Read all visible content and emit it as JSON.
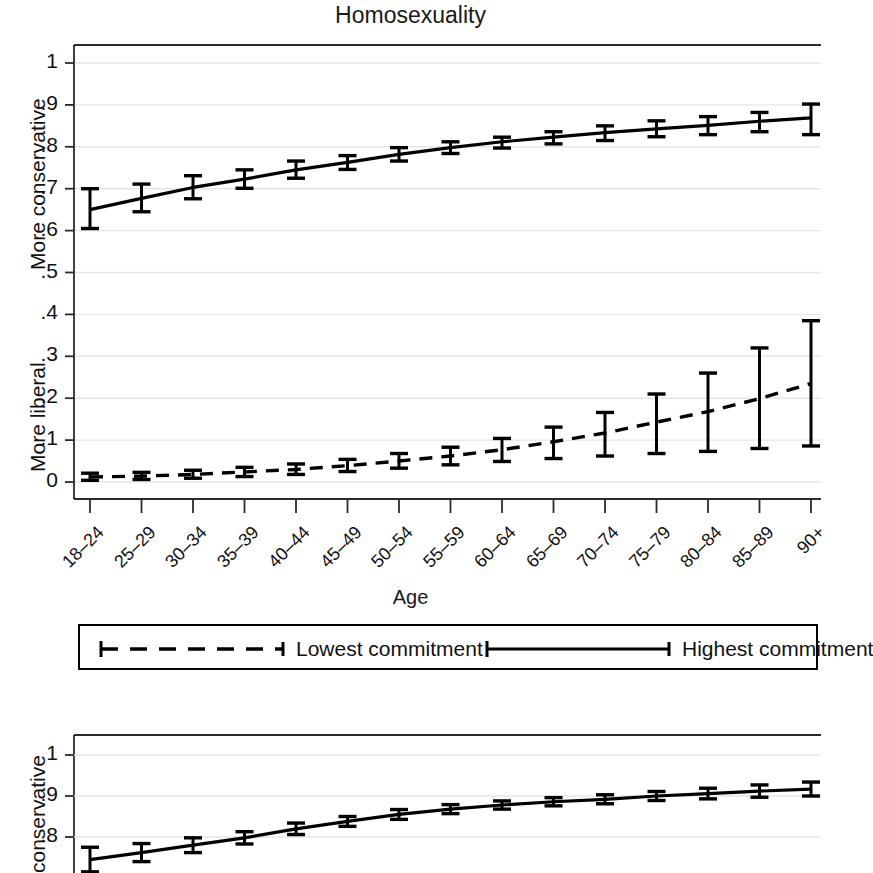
{
  "figure": {
    "xaxis_title": "Age",
    "categories": [
      "18–24",
      "25–29",
      "30–34",
      "35–39",
      "40–44",
      "45–49",
      "50–54",
      "55–59",
      "60–64",
      "65–69",
      "70–74",
      "75–79",
      "80–84",
      "85–89",
      "90+"
    ],
    "ytick_labels": [
      "1",
      ".9",
      ".8",
      ".7",
      ".6",
      ".5",
      ".4",
      ".3",
      ".2",
      ".1",
      "0"
    ],
    "ytick_values": [
      1,
      0.9,
      0.8,
      0.7,
      0.6,
      0.5,
      0.4,
      0.3,
      0.2,
      0.1,
      0
    ],
    "axis_label_conservative": "More conservative",
    "axis_label_liberal": "More liberal",
    "axis_label_conservative_bottom": "conservative"
  },
  "legend": {
    "position": "below-top-panel",
    "entries": [
      {
        "label": "Lowest commitment",
        "style": "dashed"
      },
      {
        "label": "Highest commitment",
        "style": "solid"
      }
    ]
  },
  "colors": {
    "line": "#000000",
    "grid": "#e6e6e6",
    "axis": "#2b2b2b",
    "background": "#ffffff"
  },
  "chart_data": [
    {
      "type": "line",
      "title": "Homosexuality",
      "xlabel": "Age",
      "ylabel": "More conservative / More liberal",
      "ylim": [
        0,
        1
      ],
      "ytick_values": [
        0,
        0.1,
        0.2,
        0.3,
        0.4,
        0.5,
        0.6,
        0.7,
        0.8,
        0.9,
        1
      ],
      "grid": true,
      "legend_position": "below",
      "categories": [
        "18–24",
        "25–29",
        "30–34",
        "35–39",
        "40–44",
        "45–49",
        "50–54",
        "55–59",
        "60–64",
        "65–69",
        "70–74",
        "75–79",
        "80–84",
        "85–89",
        "90+"
      ],
      "series": [
        {
          "name": "Highest commitment",
          "style": "solid",
          "values": [
            0.65,
            0.677,
            0.703,
            0.723,
            0.745,
            0.763,
            0.782,
            0.798,
            0.812,
            0.823,
            0.834,
            0.843,
            0.851,
            0.861,
            0.869
          ],
          "ci_lower": [
            0.605,
            0.645,
            0.676,
            0.701,
            0.725,
            0.746,
            0.766,
            0.784,
            0.797,
            0.807,
            0.815,
            0.824,
            0.829,
            0.836,
            0.829
          ],
          "ci_upper": [
            0.7,
            0.711,
            0.731,
            0.745,
            0.766,
            0.779,
            0.798,
            0.812,
            0.823,
            0.836,
            0.85,
            0.862,
            0.872,
            0.882,
            0.902
          ]
        },
        {
          "name": "Lowest commitment",
          "style": "dashed",
          "values": [
            0.012,
            0.014,
            0.018,
            0.024,
            0.03,
            0.039,
            0.05,
            0.062,
            0.077,
            0.096,
            0.117,
            0.143,
            0.168,
            0.199,
            0.235
          ],
          "ci_lower": [
            0.004,
            0.006,
            0.009,
            0.013,
            0.018,
            0.025,
            0.033,
            0.041,
            0.049,
            0.056,
            0.062,
            0.068,
            0.073,
            0.08,
            0.086
          ],
          "ci_upper": [
            0.021,
            0.023,
            0.028,
            0.035,
            0.043,
            0.054,
            0.068,
            0.083,
            0.104,
            0.131,
            0.166,
            0.21,
            0.26,
            0.32,
            0.385
          ]
        }
      ]
    },
    {
      "type": "line",
      "title": "Gay marriage",
      "xlabel": "Age",
      "ylabel": "conservative",
      "ylim": [
        0.6,
        1.05
      ],
      "ytick_values": [
        1,
        0.9,
        0.8
      ],
      "grid": true,
      "note": "Panel is cropped at the bottom edge of the screenshot; only the Highest commitment (solid) series is visible.",
      "categories": [
        "18–24",
        "25–29",
        "30–34",
        "35–39",
        "40–44",
        "45–49",
        "50–54",
        "55–59",
        "60–64",
        "65–69",
        "70–74",
        "75–79",
        "80–84",
        "85–89",
        "90+"
      ],
      "series": [
        {
          "name": "Highest commitment",
          "style": "solid",
          "values": [
            0.745,
            0.762,
            0.78,
            0.798,
            0.82,
            0.838,
            0.855,
            0.868,
            0.878,
            0.886,
            0.892,
            0.9,
            0.906,
            0.912,
            0.917
          ],
          "ci_lower": [
            0.715,
            0.74,
            0.762,
            0.783,
            0.806,
            0.826,
            0.843,
            0.857,
            0.868,
            0.876,
            0.881,
            0.889,
            0.893,
            0.897,
            0.9
          ],
          "ci_upper": [
            0.775,
            0.784,
            0.798,
            0.813,
            0.834,
            0.85,
            0.867,
            0.879,
            0.888,
            0.896,
            0.903,
            0.911,
            0.919,
            0.927,
            0.934
          ]
        }
      ]
    }
  ]
}
